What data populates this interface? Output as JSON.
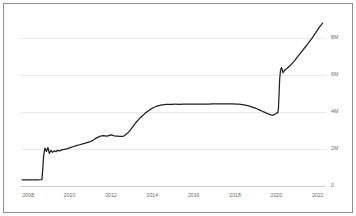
{
  "chart_data": {
    "type": "line",
    "title": "",
    "subtitle": "",
    "xlabel": "",
    "ylabel": "",
    "xlim": [
      2007.6,
      2022.4
    ],
    "ylim": [
      0,
      9400000
    ],
    "grid": true,
    "legend": null,
    "legend_position": "none",
    "line_color": "#1f1f1f",
    "grid_color": "#e9e9e9",
    "axis_color": "#cfcfcf",
    "background_color": "#ffffff",
    "border_color": "#8f8f8f",
    "x_ticks": [
      2008,
      2010,
      2012,
      2014,
      2016,
      2018,
      2020,
      2022
    ],
    "x_tick_labels": [
      "2008",
      "2010",
      "2012",
      "2014",
      "2016",
      "2018",
      "2020",
      "2022"
    ],
    "y_ticks": [
      0,
      2000000,
      4000000,
      6000000,
      8000000
    ],
    "y_tick_labels": [
      "0",
      "2M",
      "4M",
      "6M",
      "8M"
    ],
    "series": [
      {
        "name": "value",
        "x": [
          2007.7,
          2007.9,
          2008.1,
          2008.3,
          2008.45,
          2008.58,
          2008.66,
          2008.7,
          2008.74,
          2008.8,
          2008.88,
          2008.95,
          2009.02,
          2009.1,
          2009.18,
          2009.26,
          2009.34,
          2009.42,
          2009.52,
          2009.62,
          2009.74,
          2009.86,
          2010.0,
          2010.16,
          2010.32,
          2010.48,
          2010.64,
          2010.8,
          2010.96,
          2011.1,
          2011.24,
          2011.38,
          2011.5,
          2011.62,
          2011.72,
          2011.82,
          2011.92,
          2012.02,
          2012.12,
          2012.22,
          2012.32,
          2012.42,
          2012.52,
          2012.62,
          2012.72,
          2012.84,
          2012.96,
          2013.08,
          2013.2,
          2013.34,
          2013.48,
          2013.62,
          2013.76,
          2013.9,
          2014.04,
          2014.18,
          2014.32,
          2014.46,
          2014.58,
          2014.7,
          2014.82,
          2014.94,
          2015.1,
          2015.3,
          2015.5,
          2015.7,
          2015.9,
          2016.1,
          2016.3,
          2016.5,
          2016.7,
          2016.9,
          2017.1,
          2017.3,
          2017.5,
          2017.7,
          2017.9,
          2018.05,
          2018.2,
          2018.35,
          2018.5,
          2018.65,
          2018.8,
          2018.95,
          2019.08,
          2019.2,
          2019.32,
          2019.44,
          2019.56,
          2019.66,
          2019.74,
          2019.82,
          2019.9,
          2019.96,
          2020.0,
          2020.04,
          2020.07,
          2020.1,
          2020.13,
          2020.16,
          2020.2,
          2020.24,
          2020.28,
          2020.32,
          2020.38,
          2020.44,
          2020.5,
          2020.58,
          2020.66,
          2020.74,
          2020.82,
          2020.92,
          2021.02,
          2021.12,
          2021.24,
          2021.36,
          2021.48,
          2021.6,
          2021.72,
          2021.84,
          2021.96,
          2022.06,
          2022.16,
          2022.24
        ],
        "y": [
          330000,
          330000,
          332000,
          334000,
          336000,
          338000,
          340000,
          900000,
          1580000,
          2050000,
          1870000,
          2080000,
          1760000,
          1930000,
          1820000,
          1900000,
          1850000,
          1930000,
          1900000,
          1950000,
          1980000,
          2010000,
          2060000,
          2120000,
          2180000,
          2230000,
          2280000,
          2330000,
          2380000,
          2450000,
          2560000,
          2640000,
          2700000,
          2720000,
          2710000,
          2700000,
          2740000,
          2760000,
          2720000,
          2700000,
          2690000,
          2680000,
          2680000,
          2700000,
          2780000,
          2900000,
          3060000,
          3240000,
          3420000,
          3600000,
          3760000,
          3900000,
          4030000,
          4140000,
          4230000,
          4300000,
          4350000,
          4385000,
          4400000,
          4410000,
          4415000,
          4418000,
          4420000,
          4418000,
          4420000,
          4422000,
          4420000,
          4425000,
          4428000,
          4430000,
          4432000,
          4434000,
          4436000,
          4438000,
          4440000,
          4438000,
          4436000,
          4430000,
          4420000,
          4400000,
          4370000,
          4330000,
          4280000,
          4220000,
          4160000,
          4100000,
          4040000,
          3980000,
          3920000,
          3870000,
          3840000,
          3830000,
          3855000,
          3900000,
          3940000,
          3950000,
          3955000,
          4200000,
          5000000,
          5800000,
          6250000,
          6400000,
          6300000,
          6120000,
          6230000,
          6300000,
          6340000,
          6420000,
          6500000,
          6600000,
          6700000,
          6830000,
          6980000,
          7120000,
          7290000,
          7460000,
          7630000,
          7800000,
          7980000,
          8180000,
          8380000,
          8560000,
          8700000,
          8800000
        ]
      }
    ]
  },
  "axis": {
    "y_axis_name": "y-axis",
    "x_axis_name": "x-axis"
  }
}
